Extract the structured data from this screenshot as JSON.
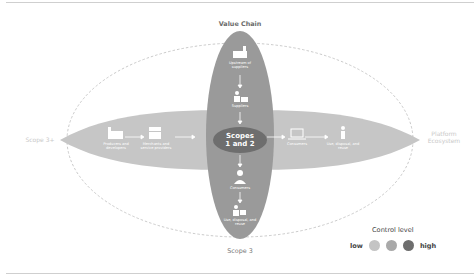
{
  "title": "Value Chain",
  "bottom_label": "Scope 3",
  "left_label": "Scope 3+",
  "right_label": "Platform Ecosystem",
  "center": {
    "line1": "Scopes",
    "line2": "1 and 2"
  },
  "vertical_chain": [
    {
      "icon": "factory-icon",
      "label": "Upstream of suppliers"
    },
    {
      "icon": "worker-icon",
      "label": "Suppliers"
    },
    {
      "icon": "person-icon",
      "label": "Consumers"
    },
    {
      "icon": "recycle-person-icon",
      "label": "Use, disposal, and reuse"
    }
  ],
  "horizontal_chain": [
    {
      "icon": "factory-icon",
      "label": "Producers and developers"
    },
    {
      "icon": "store-icon",
      "label": "Merchants and service providers"
    },
    {
      "icon": "laptop-icon",
      "label": "Consumers"
    },
    {
      "icon": "walker-icon",
      "label": "Use, disposal, and reuse"
    }
  ],
  "legend": {
    "title": "Control level",
    "low": "low",
    "high": "high",
    "colors": [
      "#c4c4c4",
      "#a9a9a9",
      "#6e6e6e"
    ]
  },
  "colors": {
    "vertical_ellipse": "#9a9a9a",
    "horizontal_ellipse": "#c6c6c6",
    "center_ellipse": "#6e6e6e",
    "dashed_outline": "#bdbdbd"
  }
}
